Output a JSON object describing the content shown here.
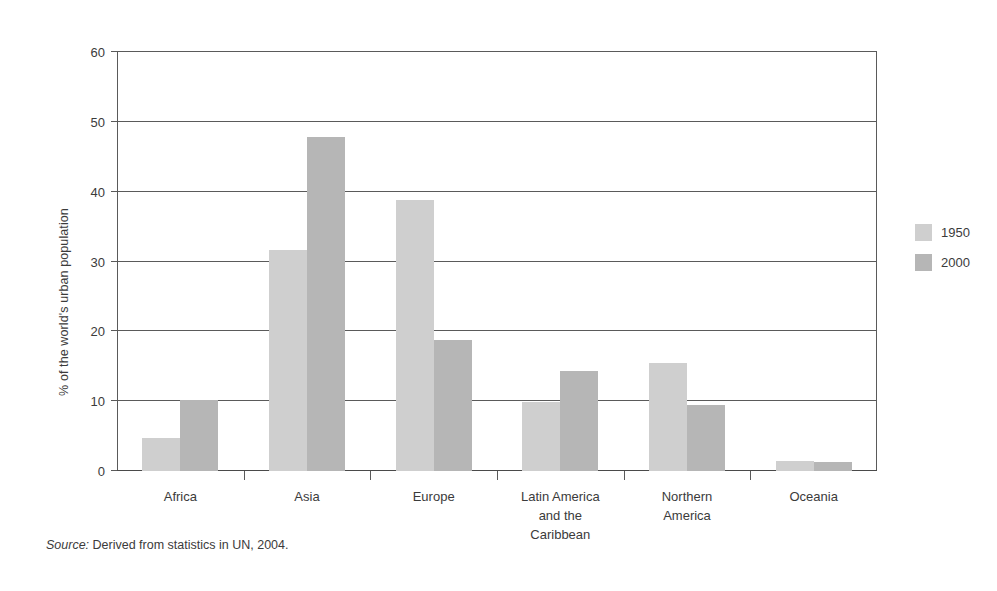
{
  "chart_data": {
    "type": "bar",
    "title": "",
    "subtitle": "",
    "xlabel": "",
    "ylabel": "% of the world's urban population",
    "ylim": [
      0,
      60
    ],
    "yticks": [
      0,
      10,
      20,
      30,
      40,
      50,
      60
    ],
    "ytick_labels": [
      "0",
      "10",
      "20",
      "30",
      "40",
      "50",
      "60"
    ],
    "grid": true,
    "legend_position": "right",
    "categories": [
      "Africa",
      "Asia",
      "Europe",
      "Latin America\nand the\nCaribbean",
      "Northern\nAmerica",
      "Oceania"
    ],
    "series": [
      {
        "name": "1950",
        "color": "#cfcfcf",
        "values": [
          4.7,
          31.7,
          38.8,
          9.9,
          15.4,
          1.5
        ]
      },
      {
        "name": "2000",
        "color": "#b6b6b6",
        "values": [
          10.2,
          47.8,
          18.8,
          14.3,
          9.4,
          1.3
        ]
      }
    ],
    "annotations": []
  },
  "legend": {
    "entries": [
      {
        "label": "1950"
      },
      {
        "label": "2000"
      }
    ]
  },
  "source": {
    "lead": "Source:",
    "text": " Derived from statistics in UN, 2004."
  },
  "colors": {
    "series_1950": "#cfcfcf",
    "series_2000": "#b6b6b6",
    "axis": "#5a5a5a",
    "text": "#3b3b3b",
    "background": "#ffffff"
  }
}
